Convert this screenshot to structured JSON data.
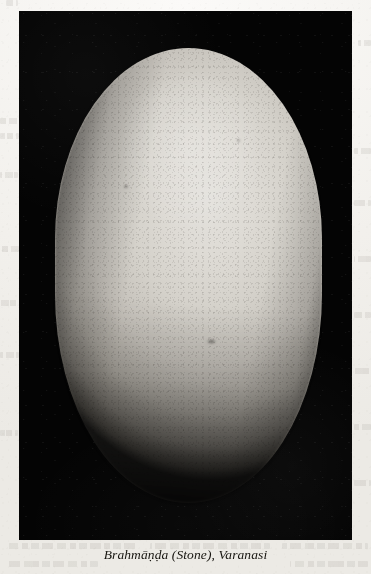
{
  "page": {
    "kind": "scanned-book-plate",
    "paper_color": "#f3f1ed",
    "plate_background_color": "#040404",
    "caption_color": "#16140f"
  },
  "plate": {
    "alt_label": "black-and-white photograph of a large pale ovoid stone",
    "subject_label": "brahmanda-stone",
    "stone_color_light": "#e3e1dc",
    "stone_color_mid": "#c3bfb8",
    "stone_color_shadow": "#4a4741"
  },
  "caption": {
    "text": "Brahmāṇḍa (Stone), Varanasi",
    "title": "Brahmāṇḍa",
    "medium": "Stone",
    "location": "Varanasi"
  },
  "ghost_text": {
    "note": "faint bleed-through lines from the reverse of the page",
    "lines": [
      {
        "x": 0,
        "y": 118,
        "w": 20
      },
      {
        "x": 0,
        "y": 133,
        "w": 19
      },
      {
        "x": 0,
        "y": 172,
        "w": 18
      },
      {
        "x": 0,
        "y": 246,
        "w": 19
      },
      {
        "x": 0,
        "y": 300,
        "w": 18
      },
      {
        "x": 0,
        "y": 352,
        "w": 19
      },
      {
        "x": 0,
        "y": 430,
        "w": 18
      },
      {
        "x": 354,
        "y": 148,
        "w": 17
      },
      {
        "x": 354,
        "y": 200,
        "w": 17
      },
      {
        "x": 354,
        "y": 256,
        "w": 17
      },
      {
        "x": 354,
        "y": 312,
        "w": 17
      },
      {
        "x": 354,
        "y": 368,
        "w": 17
      },
      {
        "x": 354,
        "y": 424,
        "w": 17
      },
      {
        "x": 354,
        "y": 480,
        "w": 17
      },
      {
        "x": 6,
        "y": 543,
        "w": 130
      },
      {
        "x": 150,
        "y": 543,
        "w": 120
      },
      {
        "x": 282,
        "y": 543,
        "w": 86
      },
      {
        "x": 6,
        "y": 561,
        "w": 92
      },
      {
        "x": 290,
        "y": 561,
        "w": 78
      },
      {
        "x": 6,
        "y": 0,
        "w": 12
      },
      {
        "x": 358,
        "y": 40,
        "w": 13
      }
    ]
  }
}
